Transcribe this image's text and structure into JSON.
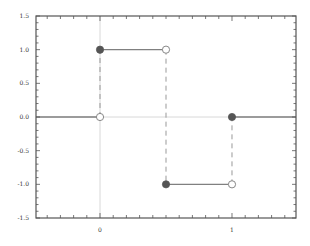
{
  "chart_data": {
    "type": "line",
    "title": "",
    "xlabel": "",
    "ylabel": "",
    "xlim": [
      -0.485,
      1.485
    ],
    "ylim": [
      -1.5,
      1.5
    ],
    "grid": false,
    "legend": null,
    "x_ticks": [
      {
        "value": 0,
        "label": "0"
      },
      {
        "value": 1,
        "label": "1"
      }
    ],
    "x_minor_step": 0.1,
    "y_ticks": [
      {
        "value": 1.5,
        "label": "1.5"
      },
      {
        "value": 1.0,
        "label": "1.0"
      },
      {
        "value": 0.5,
        "label": "0.5"
      },
      {
        "value": 0.0,
        "label": "0.0"
      },
      {
        "value": -0.5,
        "label": "-0.5"
      },
      {
        "value": -1.0,
        "label": "-1.0"
      },
      {
        "value": -1.5,
        "label": "-1.5"
      }
    ],
    "y_minor_step": 0.1,
    "axis_lines": {
      "x": 0,
      "y": 0,
      "color": "#d8d8d8"
    },
    "series": [
      {
        "name": "step function",
        "style": "piecewise-constant",
        "color": "#808080",
        "segments": [
          {
            "x": [
              -0.485,
              0
            ],
            "y": [
              0,
              0
            ]
          },
          {
            "x": [
              0,
              0.5
            ],
            "y": [
              1,
              1
            ]
          },
          {
            "x": [
              0.5,
              1
            ],
            "y": [
              -1,
              -1
            ]
          },
          {
            "x": [
              1,
              1.485
            ],
            "y": [
              0,
              0
            ]
          }
        ],
        "jumps": [
          {
            "x": 0,
            "from": 0,
            "to": 1
          },
          {
            "x": 0.5,
            "from": 1,
            "to": -1
          },
          {
            "x": 1,
            "from": -1,
            "to": 0
          }
        ],
        "filled_points": [
          [
            0,
            1
          ],
          [
            0.5,
            -1
          ],
          [
            1,
            0
          ]
        ],
        "open_points": [
          [
            0,
            0
          ],
          [
            0.5,
            1
          ],
          [
            1,
            -1
          ]
        ]
      }
    ]
  },
  "colors": {
    "frame": "#555555",
    "line": "#888888",
    "dash": "#999999",
    "filled_marker": "#555555",
    "open_marker_stroke": "#888888",
    "axis_line": "#d8d8d8"
  }
}
